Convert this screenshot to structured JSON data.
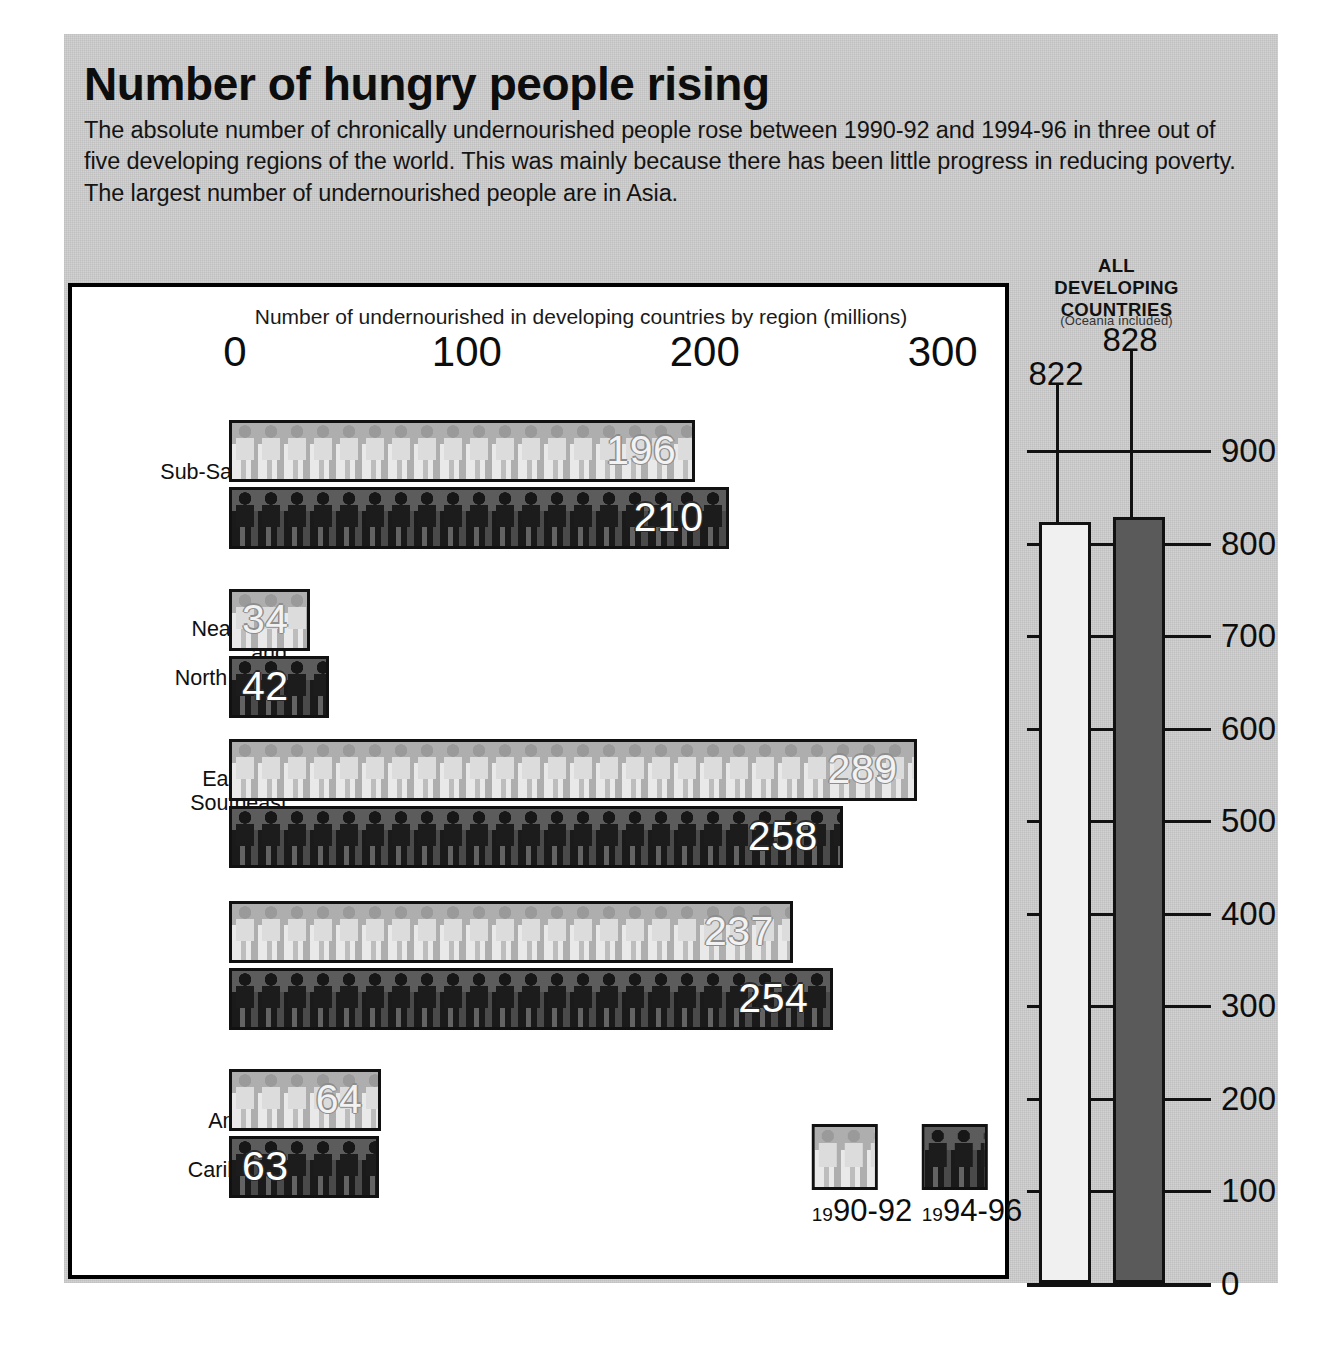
{
  "headline": {
    "title": "Number of hungry people rising",
    "deck": "The absolute number of chronically undernourished people rose between 1990-92 and 1994-96 in three out of five developing regions of the world. This was mainly because there has been little progress in reducing poverty. The largest number of undernourished people are in Asia."
  },
  "main_chart": {
    "caption": "Number of undernourished in  developing countries by region   (millions)",
    "x_ticks": [
      "0",
      "100",
      "200",
      "300"
    ]
  },
  "legend": {
    "items": [
      {
        "prefix": "19",
        "label": "90-92",
        "series": "1990-92"
      },
      {
        "prefix": "19",
        "label": "94-96",
        "series": "1994-96"
      }
    ]
  },
  "right_panel": {
    "title": "ALL\nDEVELOPING\nCOUNTRIES",
    "title_line1": "ALL",
    "title_line2": "DEVELOPING",
    "title_line3": "COUNTRIES",
    "subtitle": "(Oceania included)",
    "value_1990_92": "822",
    "value_1994_96": "828",
    "y_ticks": [
      "900",
      "800",
      "700",
      "600",
      "500",
      "400",
      "300",
      "200",
      "100",
      "0"
    ]
  },
  "colors": {
    "paper": "#d2d2d2",
    "panel": "#ffffff",
    "ink": "#111111",
    "bar_light": "#c6c6c6",
    "bar_dark": "#1e1e1e",
    "rp_bar_light": "#f0f0f0",
    "rp_bar_dark": "#5a5a5a"
  },
  "chart_data": [
    {
      "type": "bar",
      "orientation": "horizontal",
      "title": "Number of undernourished in  developing countries by region   (millions)",
      "xlabel": "millions",
      "ylabel": "",
      "xlim": [
        0,
        320
      ],
      "x_ticks": [
        0,
        100,
        200,
        300
      ],
      "grid": false,
      "legend_position": "bottom-right",
      "categories": [
        "Sub-Saharan Africa",
        "Near East and North Africa",
        "East and Southeast Asia",
        "South Asia",
        "Latin America and Caribbean"
      ],
      "series": [
        {
          "name": "1990-92",
          "values": [
            196,
            34,
            289,
            237,
            64
          ]
        },
        {
          "name": "1994-96",
          "values": [
            210,
            42,
            258,
            254,
            63
          ]
        }
      ]
    },
    {
      "type": "bar",
      "orientation": "vertical",
      "title": "ALL DEVELOPING COUNTRIES (Oceania included)",
      "xlabel": "",
      "ylabel": "millions",
      "ylim": [
        0,
        900
      ],
      "y_ticks": [
        0,
        100,
        200,
        300,
        400,
        500,
        600,
        700,
        800,
        900
      ],
      "grid": true,
      "categories": [
        "1990-92",
        "1994-96"
      ],
      "values": [
        822,
        828
      ]
    }
  ],
  "rows": [
    {
      "label_lines": [
        "Sub-Saharan",
        "Africa"
      ],
      "light": {
        "value": "196",
        "num": 196
      },
      "dark": {
        "value": "210",
        "num": 210
      }
    },
    {
      "label_lines": [
        "Near East",
        "and",
        "North Africa"
      ],
      "light": {
        "value": "34",
        "num": 34
      },
      "dark": {
        "value": "42",
        "num": 42
      }
    },
    {
      "label_lines": [
        "East and",
        "Southeast",
        "Asia"
      ],
      "light": {
        "value": "289",
        "num": 289
      },
      "dark": {
        "value": "258",
        "num": 258
      }
    },
    {
      "label_lines": [
        "South",
        "Asia"
      ],
      "light": {
        "value": "237",
        "num": 237
      },
      "dark": {
        "value": "254",
        "num": 254
      }
    },
    {
      "label_lines": [
        "Latin",
        "America",
        "and",
        "Caribbean"
      ],
      "light": {
        "value": "64",
        "num": 64
      },
      "dark": {
        "value": "63",
        "num": 63
      }
    }
  ]
}
